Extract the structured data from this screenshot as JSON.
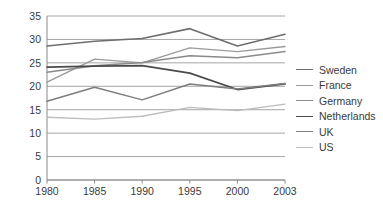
{
  "chart_data": {
    "type": "line",
    "title": "",
    "xlabel": "",
    "ylabel": "",
    "x": [
      "1980",
      "1985",
      "1990",
      "1995",
      "2000",
      "2003"
    ],
    "categories": [
      "1980",
      "1985",
      "1990",
      "1995",
      "2000",
      "2003"
    ],
    "ylim": [
      0,
      35
    ],
    "ytick_labels": [
      "0",
      "5",
      "10",
      "15",
      "20",
      "25",
      "30",
      "35"
    ],
    "ytick_values": [
      0,
      5,
      10,
      15,
      20,
      25,
      30,
      35
    ],
    "xtick_labels": [
      "1980",
      "1985",
      "1990",
      "1995",
      "2000",
      "2003"
    ],
    "grid": "horizontal",
    "legend_position": "right",
    "series": [
      {
        "name": "Sweden",
        "color": "#6e6e6e",
        "width": 1.6,
        "values": [
          28.6,
          29.6,
          30.2,
          32.3,
          28.6,
          31.1
        ]
      },
      {
        "name": "France",
        "color": "#9a9a9a",
        "width": 1.4,
        "values": [
          20.9,
          25.8,
          25.0,
          28.2,
          27.4,
          28.5
        ]
      },
      {
        "name": "Germany",
        "color": "#8a8a8a",
        "width": 1.5,
        "values": [
          23.0,
          24.4,
          25.1,
          26.5,
          26.1,
          27.4
        ]
      },
      {
        "name": "Netherlands",
        "color": "#4a4a4a",
        "width": 1.7,
        "values": [
          24.1,
          24.3,
          24.4,
          22.8,
          19.3,
          20.5
        ]
      },
      {
        "name": "UK",
        "color": "#7d7d7d",
        "width": 1.5,
        "values": [
          16.8,
          19.8,
          17.1,
          20.5,
          19.4,
          20.6
        ]
      },
      {
        "name": "US",
        "color": "#bdbdbd",
        "width": 1.4,
        "values": [
          13.4,
          13.0,
          13.6,
          15.5,
          14.8,
          16.2
        ]
      }
    ]
  },
  "axes": {
    "axis_color": "#8a8a8a",
    "grid_color": "#9c9c9c",
    "tick_color": "#3a3a3a"
  },
  "legend": {
    "entries": [
      {
        "label": "Sweden"
      },
      {
        "label": "France"
      },
      {
        "label": "Germany"
      },
      {
        "label": "Netherlands"
      },
      {
        "label": "UK"
      },
      {
        "label": "US"
      }
    ]
  }
}
